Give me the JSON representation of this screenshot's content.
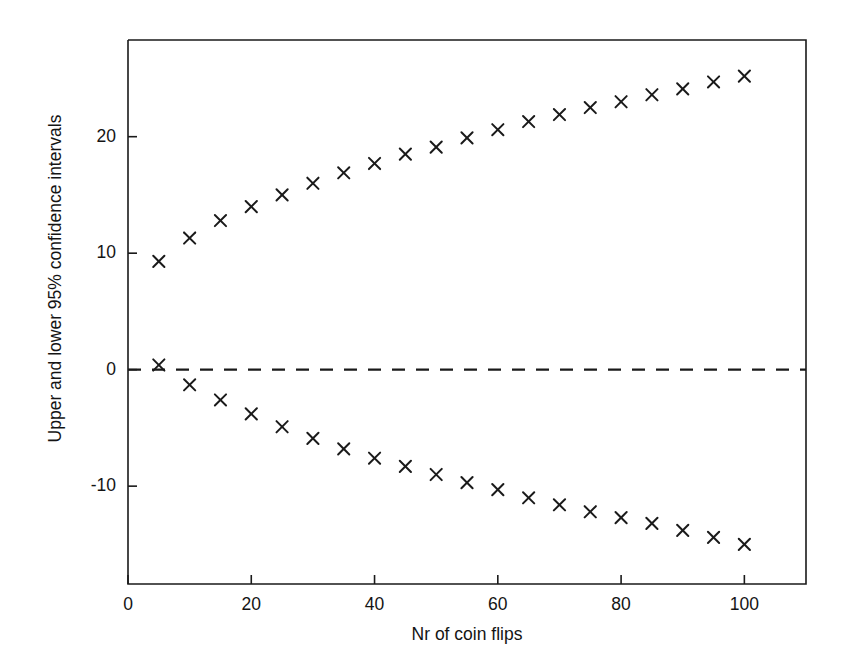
{
  "chart_data": {
    "type": "scatter",
    "title": "",
    "xlabel": "Nr of coin flips",
    "ylabel": "Upper and lower 95% confidence intervals",
    "xlim": [
      0,
      110
    ],
    "ylim": [
      -18.4,
      28.3
    ],
    "xticks": [
      0,
      20,
      40,
      60,
      80,
      100
    ],
    "xticklabels": [
      "0",
      "20",
      "40",
      "60",
      "80",
      "100"
    ],
    "yticks": [
      -10,
      0,
      10,
      20
    ],
    "yticklabels": [
      "-10",
      "0",
      "10",
      "20"
    ],
    "grid": false,
    "legend": null,
    "marker": "x",
    "marker_color": "#1a1a1a",
    "reference_lines": [
      {
        "orientation": "horizontal",
        "value": 0,
        "style": "dashed",
        "color": "#1a1a1a"
      }
    ],
    "x": [
      5,
      10,
      15,
      20,
      25,
      30,
      35,
      40,
      45,
      50,
      55,
      60,
      65,
      70,
      75,
      80,
      85,
      90,
      95,
      100
    ],
    "series": [
      {
        "name": "Upper 95% confidence interval",
        "values": [
          9.3,
          11.3,
          12.8,
          14.0,
          15.0,
          16.0,
          16.9,
          17.7,
          18.5,
          19.1,
          19.9,
          20.6,
          21.3,
          21.9,
          22.5,
          23.0,
          23.6,
          24.1,
          24.7,
          25.2
        ]
      },
      {
        "name": "Lower 95% confidence interval",
        "values": [
          0.4,
          -1.3,
          -2.6,
          -3.8,
          -4.9,
          -5.9,
          -6.8,
          -7.6,
          -8.3,
          -9.0,
          -9.7,
          -10.3,
          -11.0,
          -11.6,
          -12.2,
          -12.7,
          -13.2,
          -13.8,
          -14.4,
          -15.0
        ]
      }
    ]
  },
  "figure": {
    "background": "#ffffff",
    "axis_color": "#1a1a1a"
  }
}
